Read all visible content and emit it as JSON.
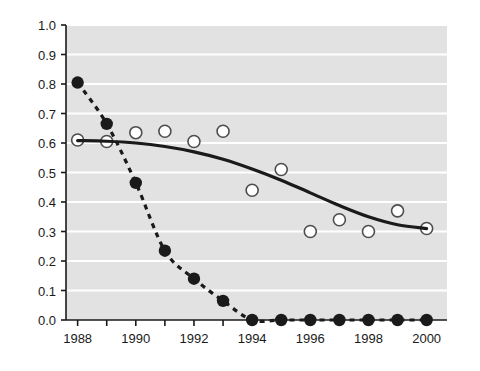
{
  "chart_data": {
    "type": "scatter",
    "title": "",
    "subtitle": "",
    "xlabel": "",
    "ylabel": "",
    "xlim": [
      1987.6,
      2000.7
    ],
    "ylim": [
      0.0,
      1.0
    ],
    "grid": true,
    "grid_color": "#ffffff",
    "plot_background": "#e2e2e2",
    "page_background": "#ffffff",
    "legend_position": "none",
    "x": [
      1988,
      1989,
      1990,
      1991,
      1992,
      1993,
      1994,
      1995,
      1996,
      1997,
      1998,
      1999,
      2000
    ],
    "xticks": [
      1988,
      1989,
      1990,
      1991,
      1992,
      1993,
      1994,
      1995,
      1996,
      1997,
      1998,
      1999,
      2000
    ],
    "xtick_labels": [
      "1988",
      "",
      "1990",
      "",
      "1992",
      "",
      "1994",
      "",
      "1996",
      "",
      "1998",
      "",
      "2000"
    ],
    "yticks": [
      0.0,
      0.1,
      0.2,
      0.3,
      0.4,
      0.5,
      0.6,
      0.7,
      0.8,
      0.9,
      1.0
    ],
    "ytick_labels": [
      "0.0",
      "0.1",
      "0.2",
      "0.3",
      "0.4",
      "0.5",
      "0.6",
      "0.7",
      "0.8",
      "0.9",
      "1.0"
    ],
    "series": [
      {
        "name": "filled-circles",
        "marker": "filled-circle",
        "marker_color": "#1a1a1a",
        "line_style": "dashed",
        "line_color": "#1a1a1a",
        "x": [
          1988,
          1989,
          1990,
          1991,
          1992,
          1993,
          1994,
          1995,
          1996,
          1997,
          1998,
          1999,
          2000
        ],
        "values": [
          0.805,
          0.665,
          0.465,
          0.235,
          0.14,
          0.065,
          0.0,
          0.0,
          0.0,
          0.0,
          0.0,
          0.0,
          0.0
        ]
      },
      {
        "name": "open-circles",
        "marker": "open-circle",
        "marker_color": "#ffffff",
        "marker_edge_color": "#4d4d4d",
        "line_style": "none",
        "x": [
          1988,
          1989,
          1990,
          1991,
          1992,
          1993,
          1994,
          1995,
          1996,
          1997,
          1998,
          1999,
          2000
        ],
        "values": [
          0.61,
          0.605,
          0.635,
          0.64,
          0.605,
          0.64,
          0.44,
          0.51,
          0.3,
          0.34,
          0.3,
          0.37,
          0.31
        ]
      },
      {
        "name": "fitted-trend-curve",
        "marker": "none",
        "line_style": "solid",
        "line_color": "#1a1a1a",
        "x": [
          1988,
          1989,
          1990,
          1991,
          1992,
          1993,
          1994,
          1995,
          1996,
          1997,
          1998,
          1999,
          2000
        ],
        "values": [
          0.608,
          0.606,
          0.6,
          0.588,
          0.57,
          0.545,
          0.512,
          0.474,
          0.431,
          0.388,
          0.35,
          0.323,
          0.31
        ]
      }
    ]
  },
  "axes": {
    "axis_color": "#1a1a1a",
    "tick_color": "#1a1a1a"
  }
}
